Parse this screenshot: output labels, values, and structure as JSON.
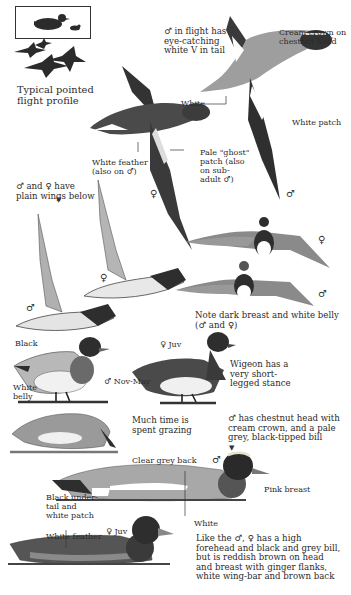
{
  "page": {
    "subject": "Wigeon",
    "colors": {
      "ink": "#2a2a2a",
      "dark_plumage": "#3a3a3a",
      "grey_plumage": "#a8a8a8",
      "chestnut_head": "#2e2e2e",
      "paper": "#ffffff"
    }
  },
  "flight_profile": {
    "caption": "Typical pointed\nflight profile"
  },
  "flight_section": {
    "male_tail_note": "♂ in flight has\neye-catching\nwhite V in tail",
    "crown_note": "Cream crown on\nchestnut head",
    "white_label": "White",
    "white_patch_label": "White patch",
    "white_feather_note": "White feather\n(also on ♂)",
    "ghost_patch_note": "Pale \"ghost\"\npatch (also\non sub-\nadult ♂)",
    "female_symbol_1": "♀",
    "male_symbol_1": "♂"
  },
  "underwing_section": {
    "plain_wings_note": "♂ and ♀ have\nplain wings below",
    "arrow": "▼",
    "female_symbol": "♀",
    "male_symbol": "♂"
  },
  "belly_section": {
    "note": "Note dark breast and white belly\n(♂ and ♀)",
    "female_symbol": "♀",
    "male_symbol": "♂"
  },
  "standing_section": {
    "black_label": "Black",
    "white_belly_label": "White\nbelly",
    "male_season": "♂ Nov-May",
    "female_juv": "♀ Juv",
    "stance_note": "Wigeon has a\nvery short-\nlegged stance"
  },
  "grazing_section": {
    "note": "Much time is\nspent grazing"
  },
  "swimming_section": {
    "male_head_note": "♂ has chestnut head with\ncream crown, and a pale\ngrey, black-tipped bill",
    "arrow": "▼",
    "clear_grey_back": "Clear grey back",
    "male_symbol": "♂",
    "pink_breast": "Pink breast",
    "black_undertail": "Black under-\ntail and\nwhite patch",
    "white_label": "White",
    "white_feather": "White feather",
    "female_juv": "♀ Juv",
    "female_note": "Like the ♂, ♀ has a high\nforehead and black and grey bill,\nbut is reddish brown on head\nand breast with ginger flanks,\nwhite wing-bar and brown back"
  }
}
